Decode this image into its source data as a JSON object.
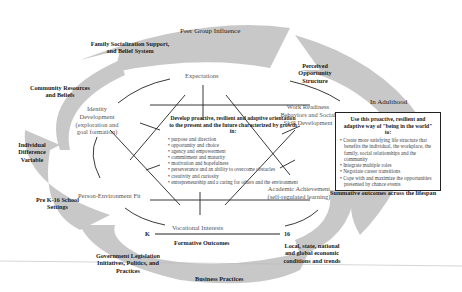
{
  "diagram": {
    "outer_arrows": {
      "peer_group": "Peer Group Influence",
      "family": "Family Socialization Support, and Belief System",
      "community": "Community Resources and Beliefs",
      "individual_difference": "Individual Difference Variable",
      "pre_k16": "Pre K-16 School Settings",
      "government": "Government Legislation Initiatives, Politics, and Practices",
      "business": "Business Practices",
      "local_state": "Local, state, national and global economic conditions and trends",
      "perceived_opportunity": "Perceived Opportunity Structure"
    },
    "nodes": {
      "expectations": "Expectations",
      "identity": "Identity Development (exploration and goal formation)",
      "work_readiness": "Work Readiness Behaviors and Social Skill Development",
      "person_env": "Person-Environment Fit",
      "academic": "Academic Achievement (self-regulated learning)",
      "vocational": "Vocational Interests"
    },
    "center": {
      "heading": "Develop proactive, resilient and adaptive orientation to the present and the future characterized by growth in:",
      "items": [
        "purpose and direction",
        "opportunity and choice",
        "agency and empowerment",
        "commitment and maturity",
        "motivation and hopefulness",
        "perseverance and an ability to overcome obstacles",
        "creativity and curiosity",
        "entrepreneurship and a caring for others and the environment"
      ]
    },
    "adulthood": {
      "label": "In Adulthood",
      "heading": "Use this proactive, resilient and adaptive way of \"being in the world\" to:",
      "items": [
        "Create more satisfying life structure that benefits the individual, the workplace, the family, social relationships and the community",
        "Integrate multiple roles",
        "Negotiate career transitions",
        "Cope with and maximize the opportunities presented by chance events"
      ],
      "summative": "Summative outcomes across the lifespan"
    },
    "timeline": {
      "start": "K",
      "end": "16",
      "label": "Formative Outcomes"
    }
  }
}
